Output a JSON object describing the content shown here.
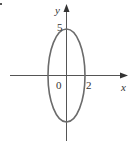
{
  "figure": {
    "type": "ellipse-graph",
    "equation_hint": "x^2/4 + y^2/25 = 1",
    "axes": {
      "x_label": "x",
      "y_label": "y",
      "origin_label": "0"
    },
    "annotations": {
      "y_intercept_label": "5",
      "x_intercept_label": "2"
    },
    "ellipse": {
      "center": [
        0,
        0
      ],
      "semi_axis_x": 2,
      "semi_axis_y": 5
    },
    "colors": {
      "curve": "#6b6b6b",
      "axes": "#555555",
      "text": "#333333"
    }
  }
}
